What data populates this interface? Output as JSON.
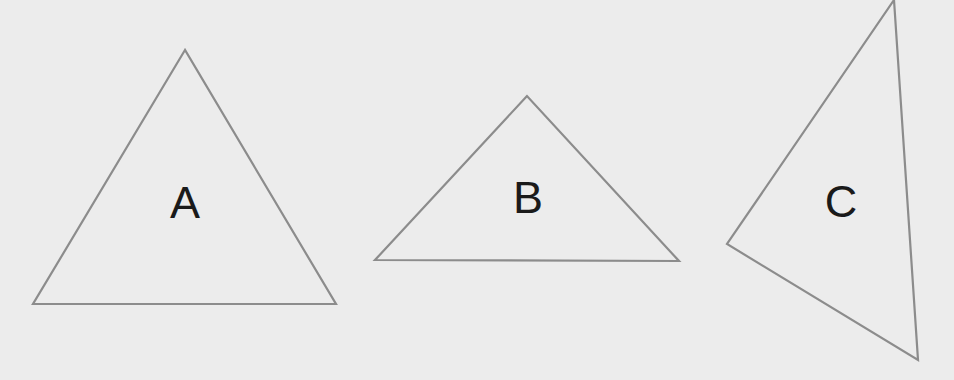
{
  "diagram": {
    "background_color": "#ececec",
    "stroke_color": "#8c8c8c",
    "label_color": "#1a1a1a",
    "shapes": [
      {
        "type": "triangle",
        "label": "A",
        "points": "185,50 33,304 336,304",
        "label_x": 185,
        "label_y": 218
      },
      {
        "type": "triangle",
        "label": "B",
        "points": "527,96 375,260 679,261",
        "label_x": 528,
        "label_y": 213
      },
      {
        "type": "triangle",
        "label": "C",
        "points": "894,0 727,244 918,360",
        "label_x": 841,
        "label_y": 217
      }
    ]
  }
}
